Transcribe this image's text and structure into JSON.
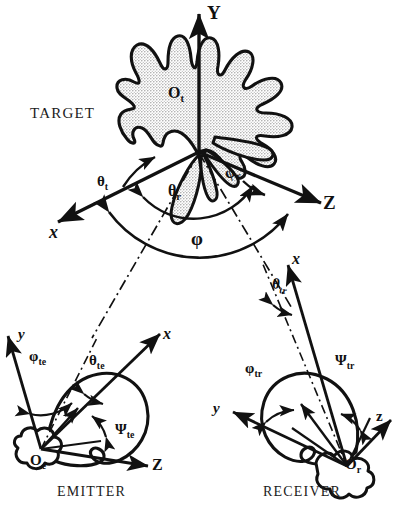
{
  "figure": {
    "type": "bistatic-radar-geometry-diagram",
    "ink_color": "#111111",
    "stipple_color": "#b9b9b9",
    "background": "#ffffff"
  },
  "target": {
    "caption": "TARGET",
    "origin": "O",
    "origin_sub": "t",
    "axes": [
      {
        "name": "y-axis",
        "label": "Y"
      },
      {
        "name": "x-axis",
        "label": "x"
      },
      {
        "name": "z-axis",
        "label": "Z"
      }
    ],
    "angles": [
      {
        "name": "theta-t",
        "label": "θ",
        "sub": "t"
      },
      {
        "name": "theta-r",
        "label": "θ",
        "sub": "r"
      },
      {
        "name": "phi-r",
        "label": "φ",
        "sub": "r"
      },
      {
        "name": "phi-bistatic",
        "label": "φ",
        "sub": ""
      }
    ]
  },
  "emitter": {
    "caption": "EMITTER",
    "origin": "O",
    "origin_sub": "e",
    "axes": [
      {
        "name": "y-axis",
        "label": "y"
      },
      {
        "name": "x-axis",
        "label": "x"
      },
      {
        "name": "z-axis",
        "label": "Z"
      }
    ],
    "angles": [
      {
        "name": "phi-te",
        "label": "φ",
        "sub": "te"
      },
      {
        "name": "theta-te",
        "label": "θ",
        "sub": "te"
      },
      {
        "name": "psi-te",
        "label": "Ψ",
        "sub": "te"
      }
    ]
  },
  "receiver": {
    "caption": "RECEIVER",
    "origin": "O",
    "origin_sub": "r",
    "axes": [
      {
        "name": "y-axis",
        "label": "y"
      },
      {
        "name": "x-axis",
        "label": "x"
      },
      {
        "name": "z-axis",
        "label": "z"
      }
    ],
    "angles": [
      {
        "name": "phi-tr",
        "label": "φ",
        "sub": "tr"
      },
      {
        "name": "theta-tr",
        "label": "θ",
        "sub": "tr"
      },
      {
        "name": "psi-tr",
        "label": "Ψ",
        "sub": "tr"
      }
    ]
  }
}
